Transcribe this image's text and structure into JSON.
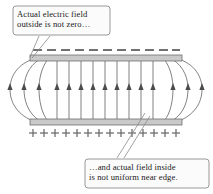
{
  "figure": {
    "background_color": "#ffffff",
    "line_color": "#5a5a5a",
    "plate_fill_color": "#c9c9c9",
    "plate_stroke_color": "#6e6e6e",
    "text_color": "#1a1a1a",
    "callout_fill_color": "#fbfbfb",
    "callout_border_color": "#8c8c8c"
  },
  "callouts": {
    "top": {
      "name": "outside-field-callout",
      "line1": "Actual electric field",
      "line2": "outside is not zero…",
      "box": {
        "x": 13,
        "y": 6,
        "w": 97,
        "h": 29
      }
    },
    "bottom": {
      "name": "inside-field-callout",
      "line1": "…and actual field inside",
      "line2": "is not uniform near edge.",
      "box": {
        "x": 85,
        "y": 159,
        "w": 124,
        "h": 29
      }
    }
  },
  "plates": {
    "top": {
      "name": "negative-plate",
      "charge_symbol": "−",
      "charge_count": 11,
      "x": 30,
      "y": 55,
      "w": 152,
      "h": 6
    },
    "bottom": {
      "name": "positive-plate",
      "charge_symbol": "+",
      "charge_count": 14,
      "x": 30,
      "y": 119,
      "w": 152,
      "h": 6
    }
  },
  "field": {
    "direction": "upward",
    "interior_line_count": 11,
    "arrow_row_y": 89,
    "interior_x_positions": [
      57,
      69,
      81,
      93,
      105,
      117,
      129,
      141,
      153,
      165
    ],
    "fringe_line_count": 6,
    "description": "Vertical uniform field lines between plates with curved fringing field lines bulging outside the plate edges."
  },
  "charges": {
    "minus_x_positions": [
      38,
      52,
      66,
      80,
      94,
      108,
      122,
      136,
      150,
      164,
      176
    ],
    "minus_y": 50,
    "plus_x_positions": [
      33,
      44,
      55,
      66,
      77,
      88,
      99,
      110,
      121,
      132,
      143,
      154,
      165,
      176
    ],
    "plus_y": 133
  }
}
